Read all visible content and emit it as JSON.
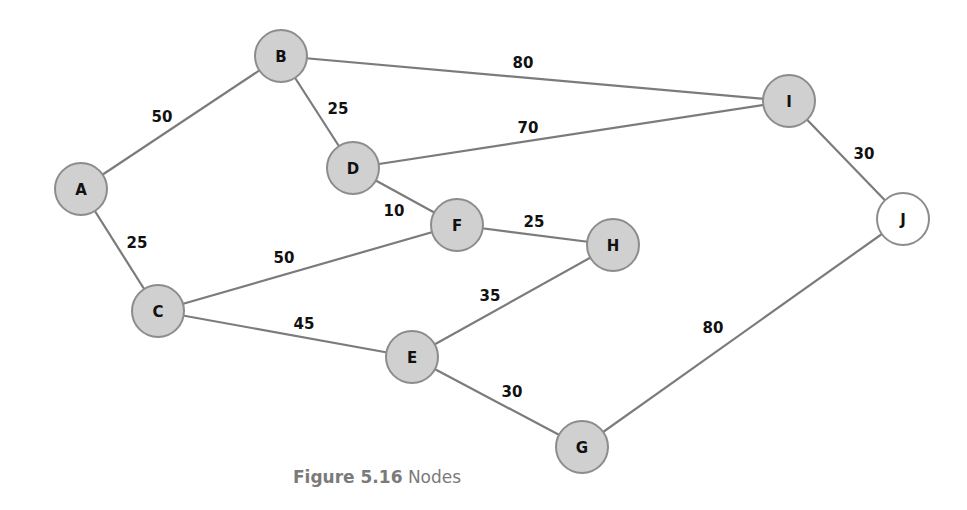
{
  "diagram": {
    "type": "weighted-undirected-graph",
    "node_radius": 26,
    "colors": {
      "node_fill": "#d0d0d0",
      "node_fill_unvisited": "#ffffff",
      "node_stroke": "#8c8c8c",
      "edge_stroke": "#7b7b7b",
      "label": "#111111",
      "caption": "#7a7a7a"
    },
    "nodes": [
      {
        "id": "A",
        "label": "A",
        "x": 81,
        "y": 189,
        "fill": "#d0d0d0"
      },
      {
        "id": "B",
        "label": "B",
        "x": 281,
        "y": 56,
        "fill": "#d0d0d0"
      },
      {
        "id": "C",
        "label": "C",
        "x": 158,
        "y": 311,
        "fill": "#d0d0d0"
      },
      {
        "id": "D",
        "label": "D",
        "x": 353,
        "y": 168,
        "fill": "#d0d0d0"
      },
      {
        "id": "E",
        "label": "E",
        "x": 412,
        "y": 357,
        "fill": "#d0d0d0"
      },
      {
        "id": "F",
        "label": "F",
        "x": 457,
        "y": 225,
        "fill": "#d0d0d0"
      },
      {
        "id": "G",
        "label": "G",
        "x": 582,
        "y": 447,
        "fill": "#d0d0d0"
      },
      {
        "id": "H",
        "label": "H",
        "x": 613,
        "y": 245,
        "fill": "#d0d0d0"
      },
      {
        "id": "I",
        "label": "I",
        "x": 789,
        "y": 101,
        "fill": "#d0d0d0"
      },
      {
        "id": "J",
        "label": "J",
        "x": 903,
        "y": 219,
        "fill": "#ffffff"
      }
    ],
    "edges": [
      {
        "from": "A",
        "to": "B",
        "weight": "50",
        "lx": 162,
        "ly": 117
      },
      {
        "from": "A",
        "to": "C",
        "weight": "25",
        "lx": 137,
        "ly": 243
      },
      {
        "from": "B",
        "to": "D",
        "weight": "25",
        "lx": 338,
        "ly": 109
      },
      {
        "from": "B",
        "to": "I",
        "weight": "80",
        "lx": 523,
        "ly": 63
      },
      {
        "from": "D",
        "to": "I",
        "weight": "70",
        "lx": 528,
        "ly": 128
      },
      {
        "from": "D",
        "to": "F",
        "weight": "10",
        "lx": 394,
        "ly": 211
      },
      {
        "from": "C",
        "to": "F",
        "weight": "50",
        "lx": 284,
        "ly": 258
      },
      {
        "from": "C",
        "to": "E",
        "weight": "45",
        "lx": 304,
        "ly": 324
      },
      {
        "from": "F",
        "to": "H",
        "weight": "25",
        "lx": 534,
        "ly": 222
      },
      {
        "from": "E",
        "to": "H",
        "weight": "35",
        "lx": 490,
        "ly": 296
      },
      {
        "from": "E",
        "to": "G",
        "weight": "30",
        "lx": 512,
        "ly": 392
      },
      {
        "from": "I",
        "to": "J",
        "weight": "30",
        "lx": 864,
        "ly": 154
      },
      {
        "from": "J",
        "to": "G",
        "weight": "80",
        "lx": 713,
        "ly": 328
      }
    ]
  },
  "caption": {
    "figure_number": "Figure 5.16",
    "title": "Nodes"
  }
}
